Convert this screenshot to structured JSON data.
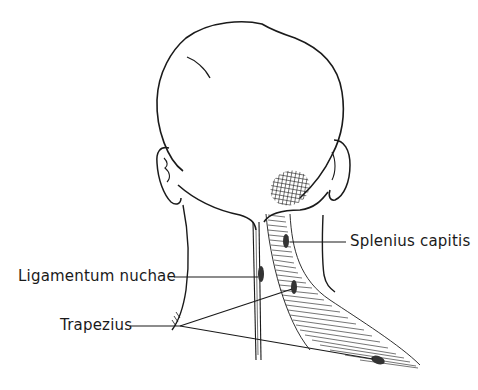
{
  "figure": {
    "type": "anatomical-illustration",
    "line_color": "#1a1a1a",
    "background": "#ffffff"
  },
  "labels": [
    {
      "id": "splenius",
      "text": "Splenius capitis"
    },
    {
      "id": "ligamentum",
      "text": "Ligamentum nuchae"
    },
    {
      "id": "trapezius",
      "text": "Trapezius"
    }
  ]
}
